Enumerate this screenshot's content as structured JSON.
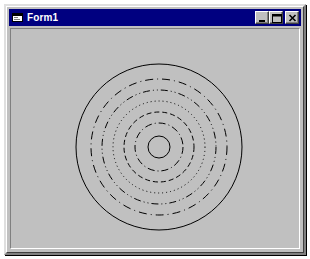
{
  "window": {
    "title": "Form1",
    "sys_icon": "form-icon",
    "background_color": "#c0c0c0",
    "titlebar_color": "#000080",
    "title_text_color": "#ffffff",
    "caption_buttons": [
      {
        "name": "minimize",
        "label": "Minimize",
        "glyph": "minimize-icon"
      },
      {
        "name": "maximize",
        "label": "Maximize",
        "glyph": "maximize-icon"
      },
      {
        "name": "close",
        "label": "Close",
        "glyph": "close-icon"
      }
    ]
  },
  "canvas": {
    "name": "drawing-canvas",
    "width": 290,
    "height": 225,
    "background_color": "#c0c0c0",
    "ink_color": "#000000",
    "center": {
      "x": 148,
      "y": 118
    },
    "rings": [
      {
        "index": 1,
        "radius": 11,
        "style": "solid",
        "dasharray": "",
        "width": 1
      },
      {
        "index": 2,
        "radius": 24,
        "style": "dash-dot",
        "dasharray": "7 3 1 3",
        "width": 1
      },
      {
        "index": 3,
        "radius": 35,
        "style": "dashed",
        "dasharray": "5 3",
        "width": 1
      },
      {
        "index": 4,
        "radius": 46,
        "style": "dotted",
        "dasharray": "1 3",
        "width": 1
      },
      {
        "index": 5,
        "radius": 57,
        "style": "dash-dot-dot",
        "dasharray": "7 3 1 3 1 3",
        "width": 1
      },
      {
        "index": 6,
        "radius": 68,
        "style": "dash-dot",
        "dasharray": "8 4 1 4",
        "width": 1
      },
      {
        "index": 7,
        "radius": 83,
        "style": "solid",
        "dasharray": "",
        "width": 1
      }
    ]
  }
}
